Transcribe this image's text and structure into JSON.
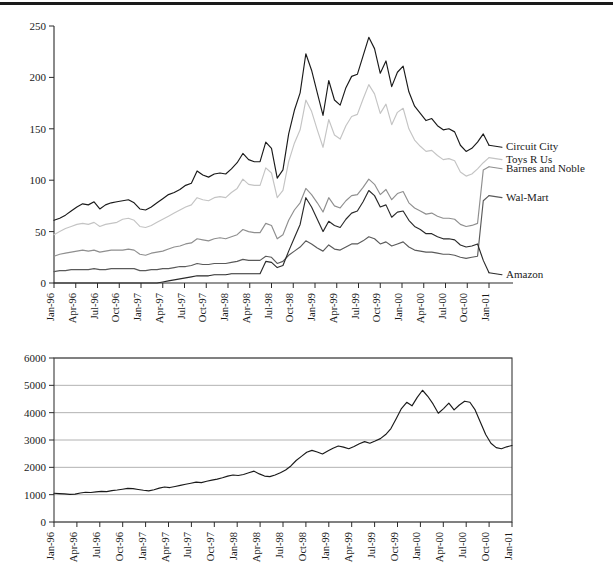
{
  "figure": {
    "divider_rule": true,
    "background": "#ffffff"
  },
  "chart_data": [
    {
      "id": "top",
      "type": "line",
      "title": "",
      "subtitle": "",
      "xlabel": "",
      "ylabel": "",
      "grid": false,
      "legend_position": "right-inline-labels",
      "ylim": [
        0,
        250
      ],
      "yticks": [
        0,
        50,
        100,
        150,
        200,
        250
      ],
      "ytick_labels": [
        "0",
        "50",
        "100",
        "150",
        "200",
        "250"
      ],
      "x": [
        "Jan-96",
        "Apr-96",
        "Jul-96",
        "Oct-96",
        "Jan-97",
        "Apr-97",
        "Jul-97",
        "Oct-97",
        "Jan-98",
        "Apr-98",
        "Jul-98",
        "Oct-98",
        "Jan-99",
        "Apr-99",
        "Jul-99",
        "Oct-99",
        "Jan-00",
        "Apr-00",
        "Jul-00",
        "Oct-00",
        "Jan-01"
      ],
      "xtick_labels": [
        "Jan-96",
        "Apr-96",
        "Jul-96",
        "Oct-96",
        "Jan-97",
        "Apr-97",
        "Jul-97",
        "Oct-97",
        "Jan-98",
        "Apr-98",
        "Jul-98",
        "Oct-98",
        "Jan-99",
        "Apr-99",
        "Jul-99",
        "Oct-99",
        "Jan-00",
        "Apr-00",
        "Jul-00",
        "Oct-00",
        "Jan-01"
      ],
      "series": [
        {
          "name": "Circuit City",
          "color": "#1a1a1a",
          "label": "Circuit City",
          "values": [
            61,
            63,
            66,
            70,
            74,
            77,
            76,
            79,
            72,
            76,
            78,
            79,
            80,
            81,
            78,
            72,
            71,
            74,
            78,
            82,
            86,
            88,
            91,
            95,
            97,
            109,
            105,
            103,
            106,
            107,
            106,
            111,
            117,
            126,
            120,
            118,
            118,
            137,
            131,
            102,
            110,
            145,
            168,
            185,
            223,
            207,
            185,
            163,
            197,
            178,
            173,
            190,
            201,
            203,
            221,
            239,
            228,
            204,
            216,
            191,
            205,
            211,
            186,
            172,
            165,
            158,
            160,
            153,
            149,
            150,
            147,
            134,
            128,
            131,
            137,
            145,
            134
          ]
        },
        {
          "name": "Toys R Us",
          "color": "#c4c4c4",
          "label": "Toys R Us",
          "values": [
            47,
            50,
            53,
            55,
            57,
            58,
            57,
            59,
            55,
            57,
            58,
            59,
            62,
            63,
            61,
            55,
            54,
            56,
            59,
            62,
            65,
            68,
            71,
            74,
            76,
            83,
            81,
            80,
            83,
            84,
            83,
            88,
            92,
            101,
            96,
            95,
            95,
            112,
            107,
            83,
            90,
            118,
            136,
            149,
            178,
            167,
            149,
            132,
            159,
            144,
            140,
            153,
            162,
            164,
            179,
            193,
            184,
            165,
            174,
            154,
            166,
            170,
            150,
            139,
            133,
            128,
            129,
            124,
            120,
            121,
            119,
            108,
            104,
            106,
            111,
            117,
            122
          ]
        },
        {
          "name": "Barnes and Noble",
          "color": "#8f8f8f",
          "label": "Barnes and Noble",
          "values": [
            26,
            28,
            29,
            30,
            31,
            32,
            31,
            32,
            30,
            31,
            32,
            32,
            32,
            33,
            32,
            28,
            27,
            29,
            30,
            31,
            33,
            35,
            36,
            38,
            39,
            43,
            42,
            41,
            43,
            44,
            43,
            45,
            47,
            52,
            50,
            49,
            49,
            58,
            56,
            43,
            47,
            61,
            71,
            78,
            92,
            86,
            78,
            69,
            83,
            75,
            73,
            80,
            85,
            86,
            93,
            101,
            96,
            86,
            91,
            81,
            87,
            89,
            78,
            73,
            70,
            67,
            68,
            65,
            63,
            63,
            62,
            57,
            55,
            56,
            58,
            110,
            113
          ]
        },
        {
          "name": "Wal-Mart",
          "color": "#5a5a5a",
          "label": "Wal-Mart",
          "values": [
            11,
            12,
            12,
            13,
            13,
            13,
            13,
            14,
            13,
            13,
            14,
            14,
            14,
            14,
            14,
            12,
            12,
            13,
            13,
            14,
            14,
            15,
            16,
            16,
            17,
            19,
            18,
            18,
            19,
            19,
            19,
            20,
            21,
            23,
            22,
            22,
            22,
            26,
            25,
            19,
            21,
            27,
            31,
            35,
            41,
            38,
            34,
            31,
            37,
            33,
            32,
            35,
            38,
            38,
            41,
            45,
            43,
            38,
            40,
            36,
            38,
            40,
            35,
            32,
            31,
            30,
            30,
            29,
            28,
            28,
            27,
            25,
            24,
            25,
            26,
            80,
            85
          ]
        },
        {
          "name": "Amazon",
          "color": "#2a2a2a",
          "label": "Amazon",
          "values": [
            0,
            0,
            0,
            0,
            0,
            0,
            0,
            0,
            0,
            0,
            0,
            0,
            0,
            0,
            0,
            0,
            0,
            0,
            0,
            1,
            2,
            3,
            4,
            5,
            6,
            7,
            7,
            7,
            8,
            8,
            8,
            9,
            9,
            9,
            9,
            9,
            9,
            21,
            20,
            15,
            17,
            31,
            44,
            57,
            83,
            74,
            62,
            50,
            60,
            56,
            54,
            62,
            68,
            70,
            79,
            90,
            85,
            74,
            76,
            64,
            69,
            70,
            61,
            55,
            52,
            48,
            48,
            45,
            43,
            43,
            42,
            37,
            35,
            36,
            38,
            22,
            10
          ]
        }
      ]
    },
    {
      "id": "bottom",
      "type": "line",
      "title": "",
      "subtitle": "",
      "xlabel": "",
      "ylabel": "",
      "grid": true,
      "legend_position": "none",
      "ylim": [
        0,
        6000
      ],
      "yticks": [
        0,
        1000,
        2000,
        3000,
        4000,
        5000,
        6000
      ],
      "ytick_labels": [
        "0",
        "1000",
        "2000",
        "3000",
        "4000",
        "5000",
        "6000"
      ],
      "x": [
        "Jan-96",
        "Apr-96",
        "Jul-96",
        "Oct-96",
        "Jan-97",
        "Apr-97",
        "Jul-97",
        "Oct-97",
        "Jan-98",
        "Apr-98",
        "Jul-98",
        "Oct-98",
        "Jan-99",
        "Apr-99",
        "Jul-99",
        "Oct-99",
        "Jan-00",
        "Apr-00",
        "Jul-00",
        "Oct-00",
        "Jan-01"
      ],
      "xtick_labels": [
        "Jan-96",
        "Apr-96",
        "Jul-96",
        "Oct-96",
        "Jan-97",
        "Apr-97",
        "Jul-97",
        "Oct-97",
        "Jan-98",
        "Apr-98",
        "Jul-98",
        "Oct-98",
        "Jan-99",
        "Apr-99",
        "Jul-99",
        "Oct-99",
        "Jan-00",
        "Apr-00",
        "Jul-00",
        "Oct-00",
        "Jan-01"
      ],
      "series": [
        {
          "name": "Index",
          "color": "#1a1a1a",
          "label": "",
          "values": [
            1050,
            1040,
            1030,
            1010,
            1020,
            1060,
            1090,
            1080,
            1100,
            1120,
            1110,
            1150,
            1170,
            1200,
            1230,
            1220,
            1190,
            1160,
            1140,
            1180,
            1240,
            1280,
            1260,
            1300,
            1340,
            1380,
            1420,
            1460,
            1440,
            1490,
            1530,
            1570,
            1620,
            1680,
            1720,
            1700,
            1740,
            1800,
            1860,
            1760,
            1680,
            1660,
            1720,
            1800,
            1900,
            2050,
            2250,
            2400,
            2550,
            2620,
            2560,
            2490,
            2600,
            2700,
            2780,
            2740,
            2680,
            2760,
            2860,
            2940,
            2880,
            2960,
            3050,
            3200,
            3420,
            3780,
            4150,
            4380,
            4250,
            4560,
            4820,
            4600,
            4320,
            3980,
            4150,
            4350,
            4100,
            4280,
            4420,
            4380,
            4100,
            3650,
            3200,
            2880,
            2720,
            2680,
            2750,
            2800
          ]
        }
      ]
    }
  ]
}
